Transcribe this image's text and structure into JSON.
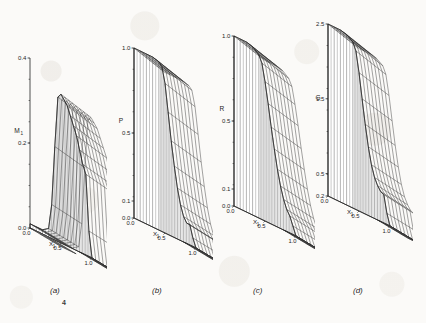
{
  "figure": {
    "background_color": "#fbfaf8",
    "ink_color": "#1f1f1f",
    "stray_mark": "4"
  },
  "panels": [
    {
      "caption": "(a)",
      "vertical_axis_label": "M",
      "vertical_axis_subscript": "1",
      "vertical_ticks": [
        "0.4",
        "0.2",
        "0.0"
      ],
      "x1_label": "X",
      "x1_subscript": "1",
      "x1_ticks": [
        "0.0",
        "0.5",
        "1.0"
      ],
      "x2_label": "X",
      "x2_subscript": "2",
      "x2_ticks": [
        "0.3"
      ]
    },
    {
      "caption": "(b)",
      "vertical_axis_label": "P",
      "vertical_axis_subscript": "",
      "vertical_ticks": [
        "1.0",
        "0.5",
        "0.1",
        "0.0"
      ],
      "x1_label": "X",
      "x1_subscript": "1",
      "x1_ticks": [
        "0.0",
        "0.5",
        "1.0"
      ],
      "x2_label": "X",
      "x2_subscript": "2",
      "x2_ticks": [
        "0.3"
      ]
    },
    {
      "caption": "(c)",
      "vertical_axis_label": "R",
      "vertical_axis_subscript": "",
      "vertical_ticks": [
        "1.0",
        "0.5",
        "0.1",
        "0.0"
      ],
      "x1_label": "X",
      "x1_subscript": "1",
      "x1_ticks": [
        "0.0",
        "0.5",
        "1.0"
      ],
      "x2_label": "X",
      "x2_subscript": "2",
      "x2_ticks": [
        "0.3"
      ]
    },
    {
      "caption": "(d)",
      "vertical_axis_label": "G",
      "vertical_axis_subscript": "",
      "vertical_ticks": [
        "2.5",
        "1.5",
        "0.5",
        "0.2"
      ],
      "x1_label": "X",
      "x1_subscript": "1",
      "x1_ticks": [
        "0.0",
        "0.5",
        "1.0"
      ],
      "x2_label": "X",
      "x2_subscript": "2",
      "x2_ticks": [
        "1.0",
        "0.3"
      ]
    }
  ],
  "chart_data": [
    {
      "type": "surface",
      "title": "(a)",
      "zlabel": "M1",
      "xlabel": "X1",
      "ylabel": "X2",
      "zlim": [
        0.0,
        0.4
      ],
      "zticks": [
        0.0,
        0.2,
        0.4
      ],
      "xlim": [
        0.0,
        1.0
      ],
      "xticks": [
        0.0,
        0.5,
        1.0
      ],
      "ylim": [
        0.3,
        1.0
      ],
      "yticks": [
        1.0,
        0.3
      ],
      "grid": true,
      "legend": "none",
      "description": "Wireframe surface: near-zero plateau for small X1, a steep rise to a ridge of about 0.35 near X1=0.45, then a descending shelf toward X1=1.0 where it falls back to about 0.0.",
      "x": [
        0.0,
        0.1,
        0.2,
        0.3,
        0.35,
        0.4,
        0.45,
        0.5,
        0.55,
        0.6,
        0.65,
        0.7,
        0.75,
        0.8,
        0.85,
        0.9,
        0.95,
        1.0
      ],
      "values": [
        0.01,
        0.01,
        0.01,
        0.02,
        0.08,
        0.22,
        0.34,
        0.35,
        0.34,
        0.33,
        0.31,
        0.29,
        0.27,
        0.24,
        0.21,
        0.19,
        0.06,
        0.0
      ]
    },
    {
      "type": "surface",
      "title": "(b)",
      "zlabel": "P",
      "xlabel": "X1",
      "ylabel": "X2",
      "zlim": [
        0.0,
        1.0
      ],
      "zticks": [
        0.0,
        0.1,
        0.5,
        1.0
      ],
      "xlim": [
        0.0,
        1.0
      ],
      "xticks": [
        0.0,
        0.5,
        1.0
      ],
      "ylim": [
        0.3,
        1.0
      ],
      "yticks": [
        1.0,
        0.3
      ],
      "grid": true,
      "legend": "none",
      "description": "Wireframe surface: a high plateau at about 1.0 for X1 below 0.45, a steep descent to a shelf near 0.12, then a final drop to about 0.0 at X1=1.0.",
      "x": [
        0.0,
        0.1,
        0.2,
        0.3,
        0.4,
        0.45,
        0.5,
        0.55,
        0.6,
        0.65,
        0.7,
        0.75,
        0.8,
        0.85,
        0.9,
        0.95,
        1.0
      ],
      "values": [
        1.0,
        1.0,
        1.0,
        1.0,
        0.99,
        0.97,
        0.88,
        0.72,
        0.56,
        0.42,
        0.3,
        0.21,
        0.15,
        0.12,
        0.12,
        0.05,
        0.0
      ]
    },
    {
      "type": "surface",
      "title": "(c)",
      "zlabel": "R",
      "xlabel": "X1",
      "ylabel": "X2",
      "zlim": [
        0.0,
        1.0
      ],
      "zticks": [
        0.0,
        0.1,
        0.5,
        1.0
      ],
      "xlim": [
        0.0,
        1.0
      ],
      "xticks": [
        0.0,
        0.5,
        1.0
      ],
      "ylim": [
        0.3,
        1.0
      ],
      "yticks": [
        1.0,
        0.3
      ],
      "grid": true,
      "legend": "none",
      "description": "Wireframe surface: plateau at about 1.0 for small X1, a long smooth descent through the midrange, reaching about 0.1 near X1=0.9 and 0.0 at X1=1.0.",
      "x": [
        0.0,
        0.1,
        0.2,
        0.3,
        0.4,
        0.45,
        0.5,
        0.55,
        0.6,
        0.65,
        0.7,
        0.75,
        0.8,
        0.85,
        0.9,
        0.95,
        1.0
      ],
      "values": [
        1.0,
        1.0,
        1.0,
        0.99,
        0.96,
        0.92,
        0.82,
        0.7,
        0.57,
        0.45,
        0.34,
        0.25,
        0.18,
        0.13,
        0.1,
        0.05,
        0.0
      ]
    },
    {
      "type": "surface",
      "title": "(d)",
      "zlabel": "G",
      "xlabel": "X1",
      "ylabel": "X2",
      "zlim": [
        0.2,
        2.5
      ],
      "zticks": [
        0.2,
        0.5,
        1.5,
        2.5
      ],
      "xlim": [
        0.0,
        1.0
      ],
      "xticks": [
        0.0,
        0.5,
        1.0
      ],
      "ylim": [
        0.3,
        1.0
      ],
      "yticks": [
        1.0,
        0.3
      ],
      "grid": true,
      "legend": "none",
      "description": "Wireframe surface: plateau at about 2.5 for small X1, a steep descent to a shelf around 0.6, then a drop to about 0.2 at X1=1.0.",
      "x": [
        0.0,
        0.1,
        0.2,
        0.3,
        0.4,
        0.45,
        0.5,
        0.55,
        0.6,
        0.65,
        0.7,
        0.75,
        0.8,
        0.85,
        0.9,
        0.95,
        1.0
      ],
      "values": [
        2.5,
        2.5,
        2.5,
        2.48,
        2.42,
        2.32,
        2.05,
        1.72,
        1.4,
        1.12,
        0.9,
        0.75,
        0.66,
        0.6,
        0.58,
        0.35,
        0.2
      ]
    }
  ]
}
